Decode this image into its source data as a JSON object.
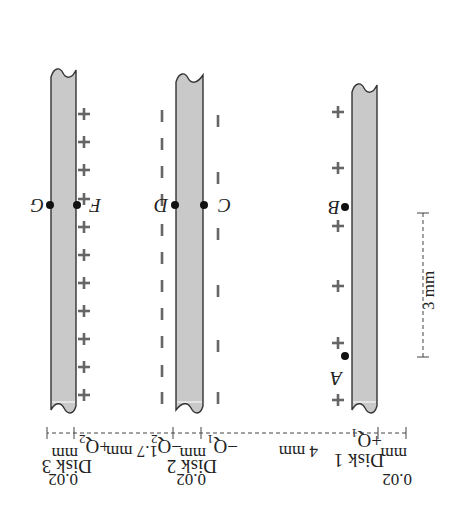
{
  "figure": {
    "orientation": "rotated-180",
    "disks": [
      {
        "id": "disk1",
        "label": "Disk 1",
        "charge": "+Q",
        "charge_sub": "1",
        "thickness": "0.02",
        "thickness_unit": "mm",
        "charge_sign": "+"
      },
      {
        "id": "disk2",
        "label": "Disk 2",
        "charge_left": "−Q",
        "charge_left_sub": "1",
        "charge_right": "−Q",
        "charge_right_sub": "2",
        "thickness": "0.02",
        "thickness_unit": "mm",
        "charge_sign": "−"
      },
      {
        "id": "disk3",
        "label": "Disk 3",
        "charge": "+Q",
        "charge_sub": "2",
        "thickness": "0.02",
        "thickness_unit": "mm",
        "charge_sign": "+"
      }
    ],
    "points": {
      "A": "A",
      "B": "B",
      "C": "C",
      "D": "D",
      "F": "F",
      "G": "G"
    },
    "dimensions": {
      "gap_1_2": "4 mm",
      "gap_2_3": "1.7 mm",
      "vertical_AB": "3 mm"
    },
    "colors": {
      "disk_fill": "#c9c9c9",
      "outline": "#333333",
      "charge_marks": "#666666"
    }
  }
}
